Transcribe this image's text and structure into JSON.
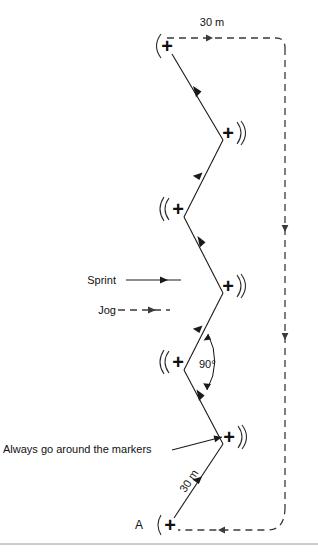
{
  "diagram": {
    "start_label": "A",
    "top_distance_label": "30 m",
    "bottom_distance_label": "30 m",
    "angle_label": "90°",
    "note_label": "Always go around the markers",
    "legend": {
      "sprint_label": "Sprint",
      "jog_label": "Jog"
    },
    "colors": {
      "sprint_line": "#1a1a1a",
      "jog_line": "#3a3a3a",
      "text": "#111111",
      "background": "#ffffff",
      "rule": "#9a9a9a"
    },
    "marker_glyph": "+",
    "markers": [
      {
        "id": "marker-top",
        "x": 167,
        "y": 46,
        "arc_side": "left"
      },
      {
        "id": "marker-2",
        "x": 228,
        "y": 133,
        "arc_side": "right"
      },
      {
        "id": "marker-3",
        "x": 178,
        "y": 209,
        "arc_side": "left"
      },
      {
        "id": "marker-4",
        "x": 228,
        "y": 286,
        "arc_side": "right"
      },
      {
        "id": "marker-5",
        "x": 178,
        "y": 362,
        "arc_side": "left"
      },
      {
        "id": "marker-6",
        "x": 229,
        "y": 437,
        "arc_side": "right"
      },
      {
        "id": "marker-start-a",
        "x": 170,
        "y": 525,
        "arc_side": "left"
      }
    ]
  }
}
